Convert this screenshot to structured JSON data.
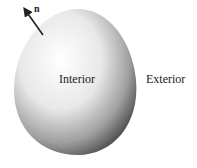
{
  "diagram": {
    "labels": {
      "interior": "Interior",
      "exterior": "Exterior",
      "normal": "n"
    },
    "colors": {
      "highlight": "#ffffff",
      "shadow": "#3a3a3a",
      "text": "#222222"
    }
  }
}
